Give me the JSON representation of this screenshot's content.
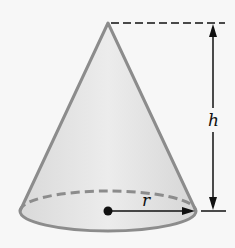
{
  "figure": {
    "labels": {
      "height": "h",
      "radius": "r"
    },
    "colors": {
      "background": "#f7f7f7",
      "cone_fill": "#e3e3e3",
      "cone_outline": "#8c8c8c",
      "dimension_lines": "#111111"
    }
  }
}
